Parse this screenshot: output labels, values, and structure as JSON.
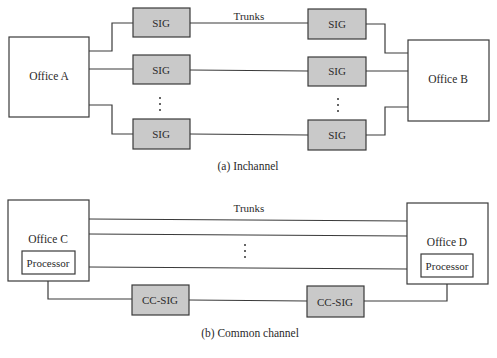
{
  "colors": {
    "sig_fill": "#c9c9c9",
    "stroke": "#3a3a3a",
    "background": "#ffffff"
  },
  "inchannel": {
    "caption": "(a) Inchannel",
    "trunks_label": "Trunks",
    "office_left": "Office A",
    "office_right": "Office B",
    "sig_boxes": [
      {
        "side": "left",
        "label": "SIG"
      },
      {
        "side": "left",
        "label": "SIG"
      },
      {
        "side": "left",
        "label": "SIG"
      },
      {
        "side": "right",
        "label": "SIG"
      },
      {
        "side": "right",
        "label": "SIG"
      },
      {
        "side": "right",
        "label": "SIG"
      }
    ],
    "ellipsis": "⋮"
  },
  "common_channel": {
    "caption": "(b) Common channel",
    "trunks_label": "Trunks",
    "office_left": "Office C",
    "office_right": "Office D",
    "processor_left": "Processor",
    "processor_right": "Processor",
    "cc_sig_left": "CC-SIG",
    "cc_sig_right": "CC-SIG",
    "ellipsis": "⋮"
  }
}
